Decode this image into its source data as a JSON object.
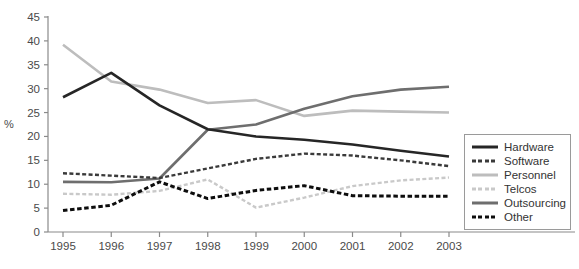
{
  "chart_data": {
    "type": "line",
    "title": "",
    "xlabel": "",
    "ylabel": "%",
    "categories": [
      "1995",
      "1996",
      "1997",
      "1998",
      "1999",
      "2000",
      "2001",
      "2002",
      "2003"
    ],
    "x": [
      1995,
      1996,
      1997,
      1998,
      1999,
      2000,
      2001,
      2002,
      2003
    ],
    "ylim": [
      0,
      45
    ],
    "yticks": [
      0,
      5,
      10,
      15,
      20,
      25,
      30,
      35,
      40,
      45
    ],
    "ytick_labels": [
      "0",
      "5",
      "10",
      "15",
      "20",
      "25",
      "30",
      "35",
      "40",
      "45"
    ],
    "grid": false,
    "legend_position": "right",
    "series": [
      {
        "name": "Hardware",
        "values": [
          28.2,
          33.3,
          26.5,
          21.5,
          20.0,
          19.3,
          18.3,
          17.0,
          15.8
        ],
        "color": "#262626",
        "style": "solid",
        "width": 2.6
      },
      {
        "name": "Software",
        "values": [
          12.3,
          11.8,
          11.3,
          13.3,
          15.3,
          16.4,
          16.0,
          15.0,
          13.8
        ],
        "color": "#3a3a3a",
        "style": "dashed",
        "width": 2.4
      },
      {
        "name": "Personnel",
        "values": [
          39.2,
          31.5,
          29.8,
          27.0,
          27.6,
          24.3,
          25.4,
          25.2,
          25.0
        ],
        "color": "#bdbdbd",
        "style": "solid",
        "width": 2.6
      },
      {
        "name": "Telcos",
        "values": [
          8.0,
          7.8,
          8.6,
          11.0,
          5.1,
          7.2,
          9.6,
          10.8,
          11.4
        ],
        "color": "#c9c9c9",
        "style": "dashed",
        "width": 2.4
      },
      {
        "name": "Outsourcing",
        "values": [
          10.5,
          10.4,
          11.2,
          21.4,
          22.5,
          25.8,
          28.4,
          29.8,
          30.4
        ],
        "color": "#6e6e6e",
        "style": "solid",
        "width": 2.6
      },
      {
        "name": "Other",
        "values": [
          4.5,
          5.6,
          10.5,
          7.0,
          8.7,
          9.7,
          7.6,
          7.5,
          7.5
        ],
        "color": "#0d0d0d",
        "style": "dashed",
        "width": 3.0
      }
    ]
  },
  "axes": {
    "y_label": "%",
    "axis_color": "#8a8a8a",
    "tick_text_color": "#4a4a4a"
  },
  "legend": {
    "entries": [
      {
        "label": "Hardware"
      },
      {
        "label": "Software"
      },
      {
        "label": "Personnel"
      },
      {
        "label": "Telcos"
      },
      {
        "label": "Outsourcing"
      },
      {
        "label": "Other"
      }
    ]
  }
}
